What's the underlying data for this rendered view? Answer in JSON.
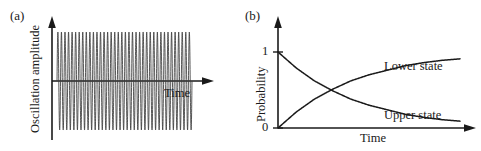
{
  "figure": {
    "background": "#ffffff",
    "ink": "#1a1a1a"
  },
  "panel_a": {
    "letter": "(a)",
    "ylabel": "Oscillation amplitude",
    "xlabel": "Time"
  },
  "panel_b": {
    "letter": "(b)",
    "ylabel": "Probability",
    "xlabel": "Time",
    "ytick_top": "1",
    "ytick_bottom": "0",
    "label_lower": "Lower state",
    "label_upper": "Upper state"
  },
  "chart_data": [
    {
      "type": "line",
      "panel": "(a)",
      "title": "",
      "xlabel": "Time",
      "ylabel": "Oscillation amplitude",
      "description": "Constant-amplitude high-frequency sinusoidal oscillation, undamped, symmetric about zero",
      "xlim": [
        0,
        1
      ],
      "ylim": [
        -1,
        1
      ],
      "grid": false,
      "legend": "none",
      "axis_ticks": [],
      "series": [
        {
          "name": "oscillation",
          "waveform": "sine",
          "amplitude": 1.0,
          "cycles": 38,
          "damping": 0.0,
          "x_start": 0.0,
          "x_end": 1.0
        }
      ]
    },
    {
      "type": "line",
      "panel": "(b)",
      "title": "",
      "xlabel": "Time",
      "ylabel": "Probability",
      "description": "Exponential population transfer: upper state decays from 1 to 0, lower state rises from 0 to 1, crossing at probability 0.5",
      "xlim": [
        0,
        1
      ],
      "ylim": [
        0,
        1
      ],
      "ytick_labels": [
        "0",
        "1"
      ],
      "ytick_values": [
        0,
        1
      ],
      "grid": false,
      "legend": "inline-annotations",
      "series": [
        {
          "name": "Upper state",
          "form": "exponential-decay",
          "x": [
            0,
            0.1,
            0.2,
            0.3,
            0.4,
            0.5,
            0.6,
            0.7,
            0.8,
            0.9,
            1.0
          ],
          "values": [
            1.0,
            0.79,
            0.62,
            0.49,
            0.38,
            0.3,
            0.24,
            0.18,
            0.14,
            0.11,
            0.09
          ]
        },
        {
          "name": "Lower state",
          "form": "exponential-rise",
          "x": [
            0,
            0.1,
            0.2,
            0.3,
            0.4,
            0.5,
            0.6,
            0.7,
            0.8,
            0.9,
            1.0
          ],
          "values": [
            0.0,
            0.21,
            0.38,
            0.51,
            0.62,
            0.7,
            0.76,
            0.82,
            0.86,
            0.89,
            0.91
          ]
        }
      ],
      "annotations": [
        {
          "text": "Lower state",
          "x": 0.62,
          "y": 0.78
        },
        {
          "text": "Upper state",
          "x": 0.62,
          "y": 0.22
        }
      ]
    }
  ]
}
